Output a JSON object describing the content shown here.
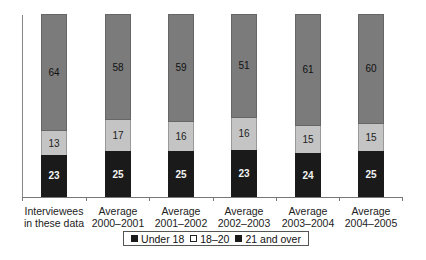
{
  "chart_data": {
    "type": "bar",
    "stacked": true,
    "percent_stacked": true,
    "title": "",
    "xlabel": "",
    "ylabel": "",
    "ylim": [
      0,
      100
    ],
    "grid": false,
    "legend_position": "bottom",
    "categories": [
      "Interviewees in these data",
      "Average 2000–2001",
      "Average 2001–2002",
      "Average 2002–2003",
      "Average 2003–2004",
      "Average 2004–2005"
    ],
    "category_lines": [
      [
        "Interviewees",
        "in these data"
      ],
      [
        "Average",
        "2000–2001"
      ],
      [
        "Average",
        "2001–2002"
      ],
      [
        "Average",
        "2002–2003"
      ],
      [
        "Average",
        "2003–2004"
      ],
      [
        "Average",
        "2004–2005"
      ]
    ],
    "series": [
      {
        "name": "Under 18",
        "color": "#1a1a1a",
        "values": [
          23,
          25,
          25,
          23,
          24,
          25
        ]
      },
      {
        "name": "18–20",
        "color": "#c4c4c4",
        "values": [
          13,
          17,
          16,
          16,
          15,
          15
        ]
      },
      {
        "name": "21 and over",
        "color": "#7b7b7b",
        "values": [
          64,
          58,
          59,
          51,
          61,
          60
        ]
      }
    ]
  },
  "legend": {
    "items": [
      {
        "label": "Under 18",
        "color": "#1a1a1a"
      },
      {
        "label": "18–20",
        "color": "#ffffff"
      },
      {
        "label": "21 and over",
        "color": "#1a1a1a"
      }
    ]
  }
}
